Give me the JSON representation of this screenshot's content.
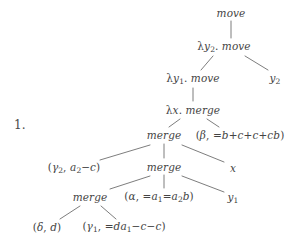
{
  "figure": {
    "item_number": "1.",
    "background_color": "#ffffff",
    "ink_color": "#444444",
    "edge_color": "#6e6e6e",
    "width": 302,
    "height": 251
  },
  "tree": {
    "description": "Minimalist-grammar derivation tree with move and merge nodes",
    "nodes": [
      {
        "id": "n0",
        "text": "move",
        "x": 231,
        "y": 13,
        "font_size": 10.5,
        "kind": "operation"
      },
      {
        "id": "n1",
        "text": "λy₂. move",
        "x": 224,
        "y": 47,
        "font_size": 10.5,
        "kind": "operation"
      },
      {
        "id": "n2",
        "text": "y₂",
        "x": 275,
        "y": 79,
        "font_size": 10.5,
        "kind": "leaf"
      },
      {
        "id": "n3",
        "text": "λy₁. move",
        "x": 193,
        "y": 79,
        "font_size": 10.5,
        "kind": "operation"
      },
      {
        "id": "n4",
        "text": "λx. merge",
        "x": 193,
        "y": 110,
        "font_size": 10.5,
        "kind": "operation"
      },
      {
        "id": "n5",
        "text": "merge",
        "x": 164,
        "y": 135,
        "font_size": 10.5,
        "kind": "operation"
      },
      {
        "id": "n6",
        "text": "(β, =b+c+c+cb)",
        "x": 240,
        "y": 135,
        "font_size": 10.5,
        "kind": "lexical"
      },
      {
        "id": "n7",
        "text": "(γ₂, a₂−c)",
        "x": 74,
        "y": 168,
        "font_size": 10.5,
        "kind": "lexical"
      },
      {
        "id": "n8",
        "text": "merge",
        "x": 164,
        "y": 167,
        "font_size": 10.5,
        "kind": "operation"
      },
      {
        "id": "n9",
        "text": "x",
        "x": 233,
        "y": 168,
        "font_size": 10.5,
        "kind": "leaf"
      },
      {
        "id": "n10",
        "text": "merge",
        "x": 90,
        "y": 197,
        "font_size": 10.5,
        "kind": "operation"
      },
      {
        "id": "n11",
        "text": "(α, =a₁=a₂b)",
        "x": 159,
        "y": 197,
        "font_size": 10.5,
        "kind": "lexical"
      },
      {
        "id": "n12",
        "text": "y₁",
        "x": 233,
        "y": 198,
        "font_size": 10.5,
        "kind": "leaf"
      },
      {
        "id": "n13",
        "text": "(δ, d)",
        "x": 47,
        "y": 227,
        "font_size": 10.5,
        "kind": "lexical"
      },
      {
        "id": "n14",
        "text": "(γ₁, =da₁−c−c)",
        "x": 124,
        "y": 227,
        "font_size": 10.5,
        "kind": "lexical"
      }
    ],
    "edges": [
      {
        "from": "n0",
        "to": "n1",
        "x1": 231,
        "y1": 21,
        "x2": 231,
        "y2": 38
      },
      {
        "from": "n1",
        "to": "n3",
        "x1": 213,
        "y1": 56,
        "x2": 201,
        "y2": 70
      },
      {
        "from": "n1",
        "to": "n2",
        "x1": 245,
        "y1": 56,
        "x2": 268,
        "y2": 70
      },
      {
        "from": "n3",
        "to": "n4",
        "x1": 193,
        "y1": 88,
        "x2": 193,
        "y2": 101
      },
      {
        "from": "n4",
        "to": "n5",
        "x1": 180,
        "y1": 119,
        "x2": 169,
        "y2": 127
      },
      {
        "from": "n4",
        "to": "n6",
        "x1": 207,
        "y1": 119,
        "x2": 219,
        "y2": 127
      },
      {
        "from": "n5",
        "to": "n7",
        "x1": 150,
        "y1": 145,
        "x2": 100,
        "y2": 160
      },
      {
        "from": "n5",
        "to": "n8",
        "x1": 164,
        "y1": 144,
        "x2": 164,
        "y2": 158
      },
      {
        "from": "n5",
        "to": "n9",
        "x1": 182,
        "y1": 145,
        "x2": 224,
        "y2": 162
      },
      {
        "from": "n8",
        "to": "n10",
        "x1": 150,
        "y1": 176,
        "x2": 110,
        "y2": 189
      },
      {
        "from": "n8",
        "to": "n11",
        "x1": 164,
        "y1": 175,
        "x2": 164,
        "y2": 188
      },
      {
        "from": "n8",
        "to": "n12",
        "x1": 182,
        "y1": 176,
        "x2": 224,
        "y2": 192
      },
      {
        "from": "n10",
        "to": "n13",
        "x1": 80,
        "y1": 206,
        "x2": 60,
        "y2": 219
      },
      {
        "from": "n10",
        "to": "n14",
        "x1": 101,
        "y1": 206,
        "x2": 116,
        "y2": 219
      }
    ]
  }
}
